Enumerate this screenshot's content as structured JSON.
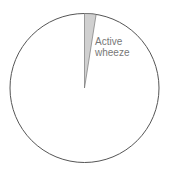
{
  "chart_data": {
    "type": "pie",
    "title": "",
    "slices": [
      {
        "label": "Active wheeze",
        "value": 2.5,
        "color": "#d0d0d0"
      },
      {
        "label": "",
        "value": 97.5,
        "color": "#ffffff"
      }
    ],
    "labels_shown": [
      "Active wheeze"
    ]
  },
  "labels": {
    "slice_line1": "Active",
    "slice_line2": "wheeze"
  }
}
